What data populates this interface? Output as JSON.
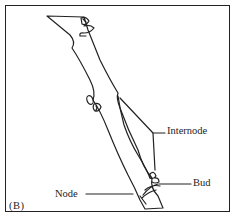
{
  "figure": {
    "panel_label": "(B)",
    "labels": {
      "internode": "Internode",
      "bud": "Bud",
      "node": "Node"
    },
    "colors": {
      "line": "#222222",
      "background": "#ffffff"
    }
  }
}
